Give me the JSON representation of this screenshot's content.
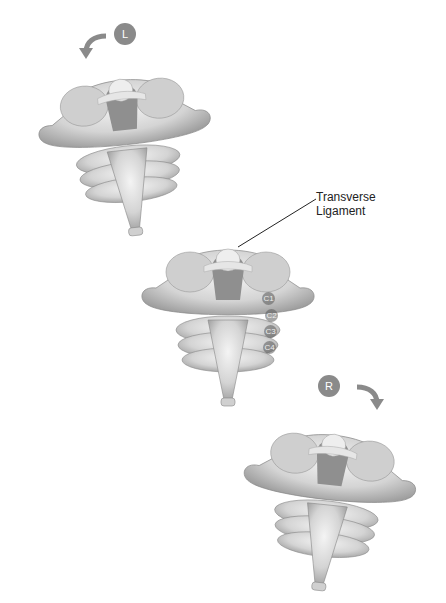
{
  "figure": {
    "views": [
      {
        "id": "left",
        "badge": "L",
        "rotation": "counter-clockwise"
      },
      {
        "id": "neutral"
      },
      {
        "id": "right",
        "badge": "R",
        "rotation": "clockwise"
      }
    ],
    "annotation": {
      "line1": "Transverse",
      "line2": "Ligament"
    },
    "vertebra_labels": [
      "C1",
      "C2",
      "C3",
      "C4"
    ]
  }
}
